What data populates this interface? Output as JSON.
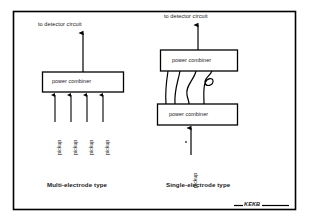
{
  "figure": {
    "name": "pickup-signal-combination-diagram",
    "frame_color": "#000000",
    "line_color": "#000000",
    "background": "#ffffff",
    "logo": "KEKB"
  },
  "left_panel": {
    "caption": "Multi-electrode type",
    "output_label": "to detector circuit",
    "combiner_label": "power combiner",
    "pickup_labels": [
      "pickup",
      "pickup",
      "pickup",
      "pickup"
    ]
  },
  "right_panel": {
    "caption": "Single-electrode type",
    "output_label": "to detector circuit",
    "combiner_top_label": "power combiner",
    "combiner_bottom_label": "power combiner",
    "pickup_labels": [
      "pickup"
    ]
  }
}
